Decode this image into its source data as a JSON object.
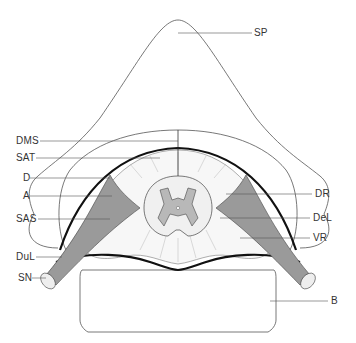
{
  "diagram": {
    "type": "anatomical cross-section",
    "labels_left": [
      {
        "key": "DMS",
        "text": "DMS",
        "y": 141
      },
      {
        "key": "SAT",
        "text": "SAT",
        "y": 158
      },
      {
        "key": "D",
        "text": "D",
        "y": 178
      },
      {
        "key": "A",
        "text": "A",
        "y": 196
      },
      {
        "key": "SAS",
        "text": "SAS",
        "y": 219
      },
      {
        "key": "DuL",
        "text": "DuL",
        "y": 257
      },
      {
        "key": "SN",
        "text": "SN",
        "y": 278
      }
    ],
    "labels_right": [
      {
        "key": "SP",
        "text": "SP",
        "y": 33
      },
      {
        "key": "DR",
        "text": "DR",
        "y": 194
      },
      {
        "key": "DeL",
        "text": "DeL",
        "y": 218
      },
      {
        "key": "VR",
        "text": "VR",
        "y": 238
      },
      {
        "key": "B",
        "text": "B",
        "y": 301
      }
    ],
    "colors": {
      "outline": "#555555",
      "dura": "#111111",
      "nerve_fill": "#9a9a9a",
      "cord_fill": "#f0f0f0",
      "gray_matter": "#b8b8b8"
    }
  }
}
